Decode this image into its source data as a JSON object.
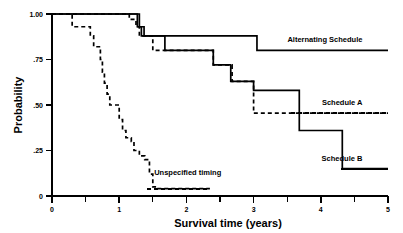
{
  "chart_data": {
    "type": "line",
    "title": "",
    "xlabel": "Survival time (years)",
    "ylabel": "Probability",
    "xlim": [
      0,
      5
    ],
    "ylim": [
      0,
      1
    ],
    "grid": false,
    "legend_position": "inline-right-annotations",
    "xticks": [
      0,
      1,
      2,
      3,
      4,
      5
    ],
    "xtick_labels": [
      "0",
      "1",
      "2",
      "3",
      "4",
      "5"
    ],
    "xticks_minor": [
      0.5,
      1.5,
      2.5,
      3.5,
      4.5
    ],
    "yticks": [
      0,
      0.25,
      0.5,
      0.75,
      1.0
    ],
    "ytick_labels": [
      "0",
      ".25",
      ".50",
      ".75",
      "1.00"
    ],
    "series": [
      {
        "name": "Alternating Schedule",
        "style": "solid",
        "label": "Alternating Schedule",
        "label_x": 4.62,
        "label_y": 0.845,
        "leader_from_x": 3.55,
        "leader_to_x": 5.0,
        "leader_y": 0.8,
        "points": [
          [
            0.0,
            1.0
          ],
          [
            1.25,
            1.0
          ],
          [
            1.3,
            0.93
          ],
          [
            1.37,
            0.88
          ],
          [
            3.0,
            0.88
          ],
          [
            3.05,
            0.8
          ],
          [
            5.0,
            0.8
          ]
        ]
      },
      {
        "name": "Schedule A",
        "style": "dashed",
        "label": "Schedule A",
        "label_x": 4.62,
        "label_y": 0.5,
        "leader_from_x": 3.55,
        "leader_to_x": 5.0,
        "leader_y": 0.455,
        "points": [
          [
            0.0,
            1.0
          ],
          [
            1.05,
            1.0
          ],
          [
            1.15,
            0.97
          ],
          [
            1.25,
            0.93
          ],
          [
            1.3,
            0.88
          ],
          [
            1.45,
            0.88
          ],
          [
            1.5,
            0.8
          ],
          [
            2.35,
            0.8
          ],
          [
            2.4,
            0.72
          ],
          [
            2.62,
            0.72
          ],
          [
            2.68,
            0.63
          ],
          [
            2.95,
            0.63
          ],
          [
            3.0,
            0.455
          ],
          [
            5.0,
            0.455
          ]
        ]
      },
      {
        "name": "Schedule B",
        "style": "solid",
        "label": "Schedule B",
        "label_x": 4.62,
        "label_y": 0.195,
        "leader_from_x": 4.3,
        "leader_to_x": 5.0,
        "leader_y": 0.15,
        "points": [
          [
            0.0,
            1.0
          ],
          [
            1.2,
            1.0
          ],
          [
            1.27,
            0.93
          ],
          [
            1.33,
            0.88
          ],
          [
            1.62,
            0.88
          ],
          [
            1.68,
            0.8
          ],
          [
            2.35,
            0.8
          ],
          [
            2.4,
            0.72
          ],
          [
            2.6,
            0.72
          ],
          [
            2.66,
            0.63
          ],
          [
            2.95,
            0.63
          ],
          [
            3.0,
            0.58
          ],
          [
            3.6,
            0.58
          ],
          [
            3.68,
            0.36
          ],
          [
            4.25,
            0.36
          ],
          [
            4.32,
            0.15
          ],
          [
            5.0,
            0.15
          ]
        ]
      },
      {
        "name": "Unspecified timing",
        "style": "dashed",
        "label": "Unspecified timing",
        "label_x": 1.52,
        "label_y": 0.115,
        "leader_from_x": 1.42,
        "leader_to_x": 2.35,
        "leader_y": 0.04,
        "points": [
          [
            0.0,
            1.0
          ],
          [
            0.25,
            1.0
          ],
          [
            0.3,
            0.93
          ],
          [
            0.52,
            0.93
          ],
          [
            0.57,
            0.88
          ],
          [
            0.62,
            0.82
          ],
          [
            0.68,
            0.82
          ],
          [
            0.72,
            0.75
          ],
          [
            0.75,
            0.68
          ],
          [
            0.78,
            0.62
          ],
          [
            0.82,
            0.56
          ],
          [
            0.86,
            0.5
          ],
          [
            0.95,
            0.5
          ],
          [
            1.0,
            0.42
          ],
          [
            1.05,
            0.36
          ],
          [
            1.1,
            0.32
          ],
          [
            1.18,
            0.3
          ],
          [
            1.22,
            0.25
          ],
          [
            1.3,
            0.22
          ],
          [
            1.38,
            0.2
          ],
          [
            1.42,
            0.2
          ],
          [
            1.45,
            0.12
          ],
          [
            1.5,
            0.05
          ],
          [
            1.55,
            0.04
          ],
          [
            2.35,
            0.04
          ]
        ]
      }
    ]
  },
  "axes": {
    "ylabel": "Probability",
    "xlabel": "Survival time (years)"
  }
}
